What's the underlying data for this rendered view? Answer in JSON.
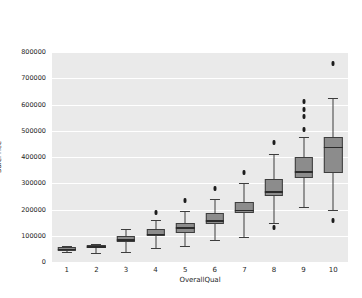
{
  "console": {
    "line1": "[ 7  6  8  5  9  4 10  3  1  2]",
    "line2": "(-0.5, 9.5, 0.0, 800000.0)"
  },
  "figure": {
    "xlabel": "OverallQual",
    "ylabel": "SalePrice",
    "box_fill_color": "#8c8c8c",
    "box_edge_color": "#3d3d3d",
    "plot_background": "#eaeaea",
    "grid_color": "#ffffff"
  },
  "chart_data": {
    "type": "box",
    "title": "",
    "xlabel": "OverallQual",
    "ylabel": "SalePrice",
    "xlim": [
      -0.5,
      9.5
    ],
    "ylim": [
      0.0,
      800000.0
    ],
    "grid": true,
    "legend": "none",
    "categories": [
      "1",
      "2",
      "3",
      "4",
      "5",
      "6",
      "7",
      "8",
      "9",
      "10"
    ],
    "xticklabels": [
      "1",
      "2",
      "3",
      "4",
      "5",
      "6",
      "7",
      "8",
      "9",
      "10"
    ],
    "yticks": [
      0,
      100000,
      200000,
      300000,
      400000,
      500000,
      600000,
      700000,
      800000
    ],
    "yticklabels": [
      "0",
      "100000",
      "200000",
      "300000",
      "400000",
      "500000",
      "600000",
      "700000",
      "800000"
    ],
    "boxes": [
      {
        "category": "1",
        "whisker_low": 39300,
        "q1": 42000,
        "median": 50150,
        "q3": 56000,
        "whisker_high": 61000,
        "fliers": []
      },
      {
        "category": "2",
        "whisker_low": 35311,
        "q1": 52000,
        "median": 60000,
        "q3": 64500,
        "whisker_high": 70000,
        "fliers": []
      },
      {
        "category": "3",
        "whisker_low": 37900,
        "q1": 77000,
        "median": 86250,
        "q3": 100000,
        "whisker_high": 125000,
        "fliers": []
      },
      {
        "category": "4",
        "whisker_low": 52500,
        "q1": 100000,
        "median": 108000,
        "q3": 126000,
        "whisker_high": 160000,
        "fliers": [
          190000
        ]
      },
      {
        "category": "5",
        "whisker_low": 61000,
        "q1": 112000,
        "median": 133000,
        "q3": 148000,
        "whisker_high": 195000,
        "fliers": [
          235000
        ]
      },
      {
        "category": "6",
        "whisker_low": 82500,
        "q1": 145000,
        "median": 160000,
        "q3": 185000,
        "whisker_high": 240000,
        "fliers": [
          280000
        ]
      },
      {
        "category": "7",
        "whisker_low": 96500,
        "q1": 185000,
        "median": 200000,
        "q3": 230000,
        "whisker_high": 300000,
        "fliers": [
          340000
        ]
      },
      {
        "category": "8",
        "whisker_low": 150000,
        "q1": 250000,
        "median": 270000,
        "q3": 315000,
        "whisker_high": 410000,
        "fliers": [
          130000,
          455000
        ]
      },
      {
        "category": "9",
        "whisker_low": 210000,
        "q1": 320000,
        "median": 345000,
        "q3": 400000,
        "whisker_high": 475000,
        "fliers": [
          505000,
          555000,
          582000,
          612000
        ]
      },
      {
        "category": "10",
        "whisker_low": 200000,
        "q1": 340000,
        "median": 440000,
        "q3": 475000,
        "whisker_high": 625000,
        "fliers": [
          160000,
          755000
        ]
      }
    ]
  }
}
